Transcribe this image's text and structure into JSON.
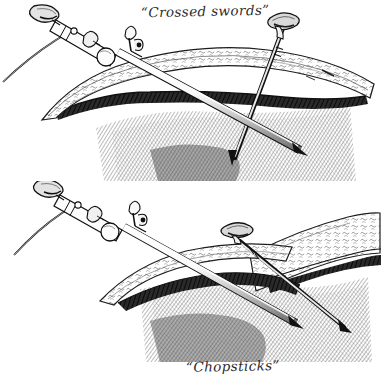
{
  "figure": {
    "kind": "pen-and-ink medical illustration",
    "background_color": "#ffffff",
    "ink_color": "#1a1a1a",
    "width": 382,
    "height": 362
  },
  "panels": [
    {
      "id": "crossed-swords",
      "caption": "“Crossed swords”",
      "position": "top",
      "description": "Laparoscope and trocar entering the abdominal wall at steep opposing angles so their shafts cross in an X below the tissue plane.",
      "elements": {
        "laparoscope_label": "laparoscope",
        "trocar_label": "trocar needle",
        "light_cable_label": "fibre-optic light cable",
        "abdominal_wall_label": "abdominal wall",
        "fat_layer_label": "subcutaneous fat",
        "fascia_layer_label": "fascia",
        "cavity_label": "peritoneal cavity"
      }
    },
    {
      "id": "chopsticks",
      "caption": "“Chopsticks”",
      "position": "bottom",
      "description": "Laparoscope and trocar inserted nearly parallel so the shafts converge like chopsticks, crossing further out at the tips.",
      "elements": {
        "laparoscope_label": "laparoscope",
        "trocar_label": "trocar needle",
        "light_cable_label": "fibre-optic light cable",
        "abdominal_wall_label": "abdominal wall",
        "fat_layer_label": "subcutaneous fat",
        "fascia_layer_label": "fascia",
        "cavity_label": "peritoneal cavity"
      }
    }
  ]
}
